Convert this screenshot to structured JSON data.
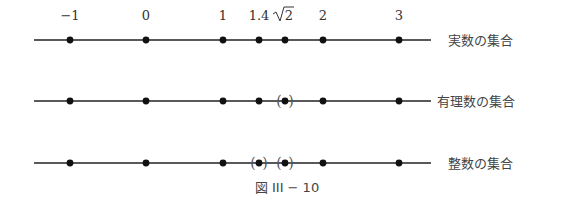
{
  "figure": {
    "caption": "図 III − 10",
    "ticks": [
      {
        "label": "−1",
        "value": -1
      },
      {
        "label": "0",
        "value": 0
      },
      {
        "label": "1",
        "value": 1
      },
      {
        "label": "1.4",
        "value": 1.4
      },
      {
        "label": "√2",
        "value": 1.41421356,
        "display": "sqrt"
      },
      {
        "label": "2",
        "value": 2
      },
      {
        "label": "3",
        "value": 3
      }
    ],
    "rows": [
      {
        "label": "実数の集合",
        "points": [
          {
            "value": -1,
            "excluded": false
          },
          {
            "value": 0,
            "excluded": false
          },
          {
            "value": 1,
            "excluded": false
          },
          {
            "value": 1.4,
            "excluded": false
          },
          {
            "value": 1.41421356,
            "excluded": false
          },
          {
            "value": 2,
            "excluded": false
          },
          {
            "value": 3,
            "excluded": false
          }
        ]
      },
      {
        "label": "有理数の集合",
        "points": [
          {
            "value": -1,
            "excluded": false
          },
          {
            "value": 0,
            "excluded": false
          },
          {
            "value": 1,
            "excluded": false
          },
          {
            "value": 1.4,
            "excluded": false
          },
          {
            "value": 1.41421356,
            "excluded": true
          },
          {
            "value": 2,
            "excluded": false
          },
          {
            "value": 3,
            "excluded": false
          }
        ]
      },
      {
        "label": "整数の集合",
        "points": [
          {
            "value": -1,
            "excluded": false
          },
          {
            "value": 0,
            "excluded": false
          },
          {
            "value": 1,
            "excluded": false
          },
          {
            "value": 1.4,
            "excluded": true
          },
          {
            "value": 1.41421356,
            "excluded": true
          },
          {
            "value": 2,
            "excluded": false
          },
          {
            "value": 3,
            "excluded": false
          }
        ]
      }
    ]
  }
}
